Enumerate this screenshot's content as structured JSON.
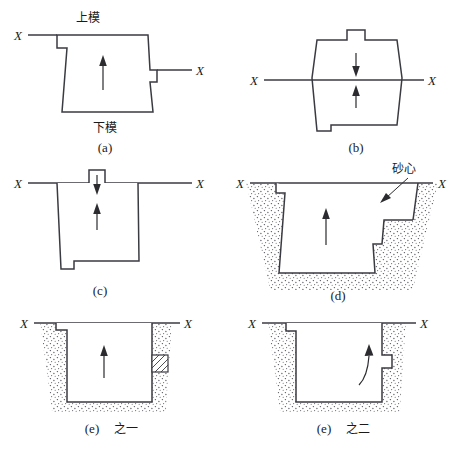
{
  "figure": {
    "background_color": "#ffffff",
    "line_color": "#3a3a42",
    "arrow_color": "#2b2b30"
  },
  "labels": {
    "x_mark": "X",
    "upper_mold": "上模",
    "lower_mold": "下模",
    "sand_core": "砂心"
  },
  "panels": [
    {
      "id": "a",
      "caption": "(a)",
      "top_label": "上模",
      "bottom_label": "下模",
      "x_left": "X",
      "x_right": "X",
      "arrow_count": 1,
      "arrow_direction": "up"
    },
    {
      "id": "b",
      "caption": "(b)",
      "x_left": "X",
      "x_right": "X",
      "arrow_count": 2,
      "arrow_direction": "up-and-down"
    },
    {
      "id": "c",
      "caption": "(c)",
      "x_left": "X",
      "x_right": "X",
      "arrow_count": 2,
      "arrow_direction": "up-and-down"
    },
    {
      "id": "d",
      "caption": "(d)",
      "x_left": "X",
      "x_right": "X",
      "annotation": "砂心",
      "arrow_count": 1,
      "arrow_direction": "up",
      "has_sand": true
    },
    {
      "id": "e1",
      "caption": "(e) 之一",
      "caption_prefix": "(e)",
      "caption_suffix": "之一",
      "x_left": "X",
      "x_right": "X",
      "arrow_count": 1,
      "arrow_direction": "up",
      "has_sand": true,
      "has_loose_piece": true
    },
    {
      "id": "e2",
      "caption": "(e) 之二",
      "caption_prefix": "(e)",
      "caption_suffix": "之二",
      "x_left": "X",
      "x_right": "X",
      "arrow_count": 1,
      "arrow_direction": "curved-up",
      "has_sand": true
    }
  ]
}
